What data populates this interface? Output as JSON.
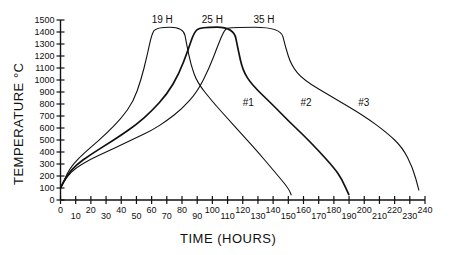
{
  "chart_data": {
    "type": "line",
    "title": "",
    "xlabel": "TIME (HOURS)",
    "ylabel": "TEMPERATURE °C",
    "xlim": [
      0,
      240
    ],
    "ylim": [
      0,
      1500
    ],
    "grid": false,
    "legend": "none (inline curve labels)",
    "x_ticks": [
      0,
      10,
      20,
      30,
      40,
      50,
      60,
      70,
      80,
      90,
      100,
      110,
      120,
      130,
      140,
      150,
      160,
      170,
      180,
      190,
      200,
      210,
      220,
      230,
      240
    ],
    "y_ticks": [
      0,
      100,
      200,
      300,
      400,
      500,
      600,
      700,
      800,
      900,
      1000,
      1100,
      1200,
      1300,
      1400,
      1500
    ],
    "annotations": [
      {
        "text": "19 H",
        "x": 67,
        "y": 1490,
        "note": "hold duration curve #1"
      },
      {
        "text": "25 H",
        "x": 100,
        "y": 1490,
        "note": "hold duration curve #2"
      },
      {
        "text": "35 H",
        "x": 134,
        "y": 1490,
        "note": "hold duration curve #3"
      }
    ],
    "series": [
      {
        "name": "#1",
        "label_pos": {
          "x": 120,
          "y": 780
        },
        "points": [
          [
            0,
            100
          ],
          [
            3,
            180
          ],
          [
            6,
            260
          ],
          [
            12,
            350
          ],
          [
            20,
            440
          ],
          [
            30,
            550
          ],
          [
            40,
            680
          ],
          [
            48,
            820
          ],
          [
            53,
            1000
          ],
          [
            57,
            1200
          ],
          [
            60,
            1380
          ],
          [
            63,
            1440
          ],
          [
            81,
            1440
          ],
          [
            83,
            1300
          ],
          [
            86,
            1120
          ],
          [
            90,
            980
          ],
          [
            100,
            820
          ],
          [
            110,
            680
          ],
          [
            120,
            540
          ],
          [
            130,
            400
          ],
          [
            140,
            250
          ],
          [
            150,
            100
          ],
          [
            152,
            40
          ]
        ]
      },
      {
        "name": "#2",
        "label_pos": {
          "x": 158,
          "y": 780
        },
        "points": [
          [
            0,
            100
          ],
          [
            4,
            200
          ],
          [
            10,
            290
          ],
          [
            20,
            380
          ],
          [
            30,
            460
          ],
          [
            40,
            540
          ],
          [
            50,
            630
          ],
          [
            60,
            740
          ],
          [
            70,
            880
          ],
          [
            78,
            1050
          ],
          [
            84,
            1250
          ],
          [
            88,
            1400
          ],
          [
            92,
            1440
          ],
          [
            114,
            1440
          ],
          [
            117,
            1250
          ],
          [
            120,
            1080
          ],
          [
            126,
            960
          ],
          [
            140,
            790
          ],
          [
            150,
            660
          ],
          [
            160,
            540
          ],
          [
            170,
            410
          ],
          [
            180,
            270
          ],
          [
            185,
            180
          ],
          [
            190,
            40
          ]
        ]
      },
      {
        "name": "#3",
        "label_pos": {
          "x": 196,
          "y": 780
        },
        "points": [
          [
            0,
            100
          ],
          [
            4,
            190
          ],
          [
            10,
            270
          ],
          [
            20,
            340
          ],
          [
            30,
            400
          ],
          [
            40,
            460
          ],
          [
            50,
            520
          ],
          [
            60,
            580
          ],
          [
            70,
            660
          ],
          [
            80,
            760
          ],
          [
            90,
            900
          ],
          [
            98,
            1100
          ],
          [
            104,
            1300
          ],
          [
            108,
            1420
          ],
          [
            111,
            1440
          ],
          [
            145,
            1440
          ],
          [
            148,
            1280
          ],
          [
            152,
            1120
          ],
          [
            160,
            1000
          ],
          [
            180,
            850
          ],
          [
            200,
            700
          ],
          [
            215,
            560
          ],
          [
            225,
            440
          ],
          [
            232,
            270
          ],
          [
            236,
            80
          ]
        ]
      }
    ]
  },
  "axes": {
    "x_title": "TIME (HOURS)",
    "y_title": "TEMPERATURE °C"
  }
}
